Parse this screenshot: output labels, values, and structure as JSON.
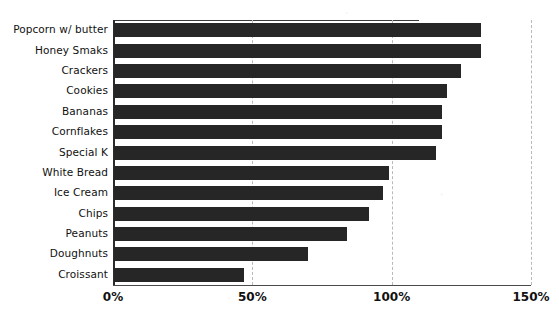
{
  "chart_data": {
    "type": "bar",
    "orientation": "horizontal",
    "title": "",
    "subtitle": "",
    "xlabel": "",
    "ylabel": "",
    "categories": [
      "Popcorn w/ butter",
      "Honey Smaks",
      "Crackers",
      "Cookies",
      "Bananas",
      "Cornflakes",
      "Special K",
      "White Bread",
      "Ice Cream",
      "Chips",
      "Peanuts",
      "Doughnuts",
      "Croissant"
    ],
    "values": [
      132,
      132,
      125,
      120,
      118,
      118,
      116,
      99,
      97,
      92,
      84,
      70,
      47
    ],
    "xlim": [
      0,
      150
    ],
    "xticks": [
      0,
      50,
      100,
      150
    ],
    "xtick_labels": [
      "0%",
      "50%",
      "100%",
      "150%"
    ],
    "grid": "vertical-dashed",
    "legend": "none",
    "bar_color": "#262626",
    "axis_color": "#2b2b2b",
    "gridline_color": "#b9b9b9",
    "value_labels_shown": false
  }
}
